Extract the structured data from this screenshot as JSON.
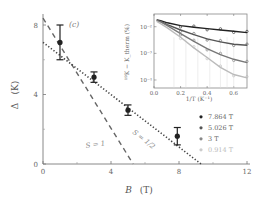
{
  "chart_data": [
    {
      "id": "main",
      "type": "scatter",
      "panel_label": "(c)",
      "xlabel": "B (T)",
      "ylabel": "Δ (K)",
      "xlim": [
        0,
        12
      ],
      "ylim": [
        0,
        8
      ],
      "xticks": [
        0,
        4,
        8,
        12
      ],
      "yticks": [
        0,
        4,
        8
      ],
      "grid": false,
      "series": [
        {
          "name": "Δ data",
          "x": [
            1.0,
            3.0,
            5.0,
            7.9
          ],
          "y": [
            7.0,
            5.0,
            3.1,
            1.6
          ],
          "yerr": [
            1.0,
            0.3,
            0.3,
            0.5
          ],
          "marker": "filled-circle",
          "color": "#222222"
        }
      ],
      "fits": [
        {
          "name": "S = 1",
          "label": "S = 1",
          "style": "dashed",
          "x": [
            0,
            5.3
          ],
          "y": [
            8.4,
            0
          ],
          "color": "#666666"
        },
        {
          "name": "S = 1/2",
          "label": "S = 1/2",
          "style": "dotted",
          "x": [
            0,
            9.3
          ],
          "y": [
            7.0,
            0
          ],
          "color": "#444444"
        }
      ]
    },
    {
      "id": "inset",
      "type": "line",
      "xlabel": "1/T (K⁻¹)",
      "ylabel": "¹⁹K − K_therm (%)",
      "yscale": "log",
      "xlim": [
        0.0,
        0.7
      ],
      "ylim": [
        5e-05,
        0.03
      ],
      "xticks": [
        0.0,
        0.2,
        0.4,
        0.6
      ],
      "xtick_labels": [
        "0.0",
        "0.2",
        "0.4",
        "0.6"
      ],
      "ytick_labels": [
        "10⁻²",
        "10⁻³",
        "10⁻⁴"
      ],
      "yticks": [
        0.01,
        0.001,
        0.0001
      ],
      "series": [
        {
          "name": "7.864 T",
          "color": "#222222",
          "x": [
            0.02,
            0.05,
            0.1,
            0.2,
            0.3,
            0.4,
            0.5,
            0.6,
            0.7
          ],
          "y": [
            0.018,
            0.017,
            0.014,
            0.011,
            0.0095,
            0.0085,
            0.0075,
            0.0068,
            0.006
          ]
        },
        {
          "name": "5.026 T",
          "color": "#555555",
          "x": [
            0.02,
            0.05,
            0.1,
            0.2,
            0.3,
            0.4,
            0.5,
            0.6,
            0.7
          ],
          "y": [
            0.018,
            0.016,
            0.012,
            0.0075,
            0.005,
            0.0035,
            0.0027,
            0.0022,
            0.002
          ]
        },
        {
          "name": "3 T",
          "color": "#777777",
          "x": [
            0.02,
            0.05,
            0.1,
            0.2,
            0.3,
            0.4,
            0.5,
            0.6,
            0.7
          ],
          "y": [
            0.017,
            0.015,
            0.011,
            0.0055,
            0.0028,
            0.0015,
            0.0009,
            0.0006,
            0.00045
          ]
        },
        {
          "name": "0.914 T",
          "color": "#bbbbbb",
          "x": [
            0.02,
            0.05,
            0.1,
            0.2,
            0.3,
            0.4,
            0.5,
            0.6,
            0.7
          ],
          "y": [
            0.016,
            0.013,
            0.009,
            0.004,
            0.0016,
            0.0007,
            0.0003,
            0.00016,
            0.00012
          ]
        }
      ],
      "legend": {
        "position": "lower-right-outside-inset",
        "entries": [
          {
            "label": "7.864 T",
            "color": "#222222"
          },
          {
            "label": "5.026 T",
            "color": "#555555"
          },
          {
            "label": "3 T",
            "color": "#888888"
          },
          {
            "label": "0.914 T",
            "color": "#cccccc"
          }
        ]
      }
    }
  ],
  "labels": {
    "panel": "(c)",
    "main_xlabel_var": "B",
    "main_xlabel_unit": "(T)",
    "main_ylabel_var": "Δ",
    "main_ylabel_unit": "(K)",
    "fit_s1": "S = 1",
    "fit_shalf": "S = 1/2",
    "inset_xlabel": "1/T (K⁻¹)",
    "inset_ylabel": "¹⁹K − K_therm (%)"
  }
}
